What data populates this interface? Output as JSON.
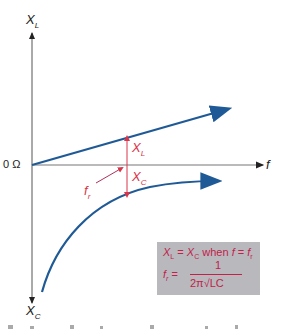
{
  "diagram": {
    "axes": {
      "y_top_label": "X",
      "y_top_sub": "L",
      "y_bottom_label": "X",
      "y_bottom_sub": "C",
      "x_label": "f",
      "origin_label": "0 Ω"
    },
    "curves": [
      {
        "name": "XL",
        "shape": "rising straight line",
        "color": "#1f5a96"
      },
      {
        "name": "XC",
        "shape": "negative curve approaching zero",
        "color": "#1f5a96"
      }
    ],
    "annotations": {
      "xl_arrow_label": "X",
      "xl_arrow_sub": "L",
      "xc_arrow_label": "X",
      "xc_arrow_sub": "C",
      "fr_label": "f",
      "fr_sub": "r",
      "arrow_color": "#d9344a"
    },
    "formula_box": {
      "line1_a": "X",
      "line1_a_sub": "L",
      "line1_eq": " = ",
      "line1_b": "X",
      "line1_b_sub": "C",
      "line1_when": " when ",
      "line1_f": "f",
      "line1_eq2": " = ",
      "line1_fr": "f",
      "line1_fr_sub": "r",
      "fr_lhs": "f",
      "fr_lhs_sub": "r",
      "fr_eq": " =",
      "numerator": "1",
      "denominator": "2π√LC",
      "background": "#b9b9bd",
      "text_color": "#c0224a"
    }
  }
}
